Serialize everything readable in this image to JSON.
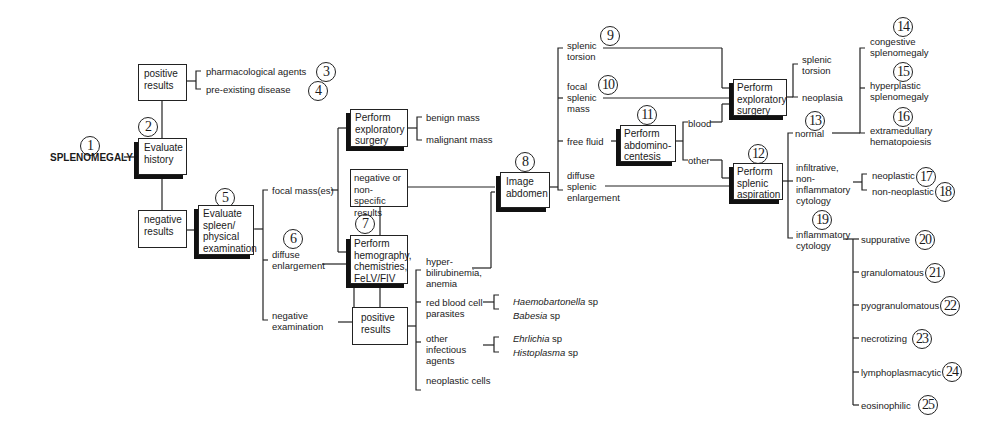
{
  "title": "SPLENOMEGALY",
  "step_numbers": [
    "1",
    "2",
    "3",
    "4",
    "5",
    "6",
    "7",
    "8",
    "9",
    "10",
    "11",
    "12",
    "13",
    "14",
    "15",
    "16",
    "17",
    "18",
    "19",
    "20",
    "21",
    "22",
    "23",
    "24",
    "25"
  ],
  "nodes": {
    "evaluate_history": "Evaluate history",
    "history_positive": "positive results",
    "pharmacological_agents": "pharmacological agents",
    "preexisting_disease": "pre-existing disease",
    "history_negative": "negative results",
    "evaluate_spleen": "Evaluate spleen/ physical examination",
    "focal_masses": "focal mass(es)",
    "diffuse_enlargement": "diffuse enlargement",
    "negative_examination": "negative examination",
    "exploratory_surgery_1": "Perform exploratory surgery",
    "benign_mass": "benign mass",
    "malignant_mass": "malignant mass",
    "negative_nonspecific": "negative or non-specific results",
    "perform_hemography": "Perform hemography, chemistries, FeLV/FIV",
    "lab_positive": "positive results",
    "hyperbilirubinemia": "hyper- bilirubinemia, anemia",
    "rbc_parasites": "red blood cell parasites",
    "haemobartonella": "Haemobartonella",
    "haemobartonella_sp": "sp",
    "babesia": "Babesia",
    "babesia_sp": "sp",
    "other_infectious": "other infectious agents",
    "ehrlichia": "Ehrlichia",
    "ehrlichia_sp": "sp",
    "histoplasma": "Histoplasma",
    "histoplasma_sp": "sp",
    "neoplastic_cells": "neoplastic cells",
    "image_abdomen": "Image abdomen",
    "splenic_torsion": "splenic torsion",
    "focal_splenic_mass": "focal splenic mass",
    "free_fluid": "free fluid",
    "diffuse_splenic_enlargement": "diffuse splenic enlargement",
    "abdominocentesis": "Perform abdomino- centesis",
    "blood": "blood",
    "other": "other",
    "exploratory_surgery_2": "Perform exploratory surgery",
    "surgery_splenic_torsion": "splenic torsion",
    "neoplasia": "neoplasia",
    "splenic_aspiration": "Perform splenic aspiration",
    "normal": "normal",
    "congestive": "congestive splenomegaly",
    "hyperplastic": "hyperplastic splenomegaly",
    "extramedullary": "extramedullary hematopoiesis",
    "infiltrative": "infiltrative, non- inflammatory cytology",
    "neoplastic": "neoplastic",
    "non_neoplastic": "non-neoplastic",
    "inflammatory": "inflammatory cytology",
    "suppurative": "suppurative",
    "granulomatous": "granulomatous",
    "pyogranulomatous": "pyogranulomatous",
    "necrotizing": "necrotizing",
    "lymphoplasmacytic": "lymphoplasmacytic",
    "eosinophilic": "eosinophilic"
  }
}
